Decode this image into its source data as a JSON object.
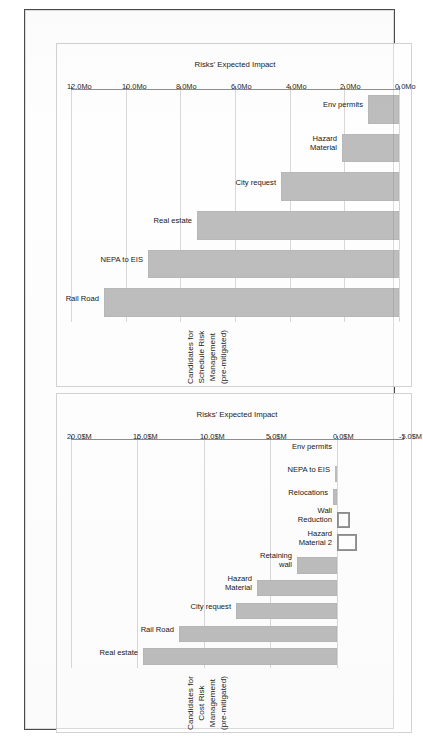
{
  "document": {
    "kind": "scanned-report-page",
    "orientation": "rotated-90-ccw",
    "page_background": "#fefefe",
    "border_color": "#4a4a4a"
  },
  "palette": {
    "bar_fill": "#bdbdbd",
    "bar_negative_fill": "#ffffff",
    "bar_negative_stroke": "#8c8c8c",
    "gridline": "#d8d8d8",
    "axis": "#8e8e8e",
    "text": "#1b1b1b"
  },
  "charts": [
    {
      "id": "schedule",
      "title_line1": "Candidates for Schedule Risk Management",
      "title_line2": "(pre-mitigated)",
      "axis_title": "Risks' Expected Impact"
    },
    {
      "id": "cost",
      "title_line1": "Candidates for Cost Risk Management",
      "title_line2": "(pre-mitigated)",
      "axis_title": "Risks' Expected Impact"
    }
  ],
  "chart_data": [
    {
      "type": "bar",
      "id": "schedule",
      "orientation": "vertical",
      "title": "Candidates for Schedule Risk Management (pre-mitigated)",
      "subtitle": "(pre-mitigated)",
      "xlabel": "",
      "ylabel": "Risks' Expected Impact",
      "unit": "Mo",
      "ylim": [
        0.0,
        12.0
      ],
      "ticks": [
        0.0,
        2.0,
        4.0,
        6.0,
        8.0,
        10.0,
        12.0
      ],
      "ticklabels": [
        "0.0Mo",
        "2.0Mo",
        "4.0Mo",
        "6.0Mo",
        "8.0Mo",
        "10.0Mo",
        "12.0Mo"
      ],
      "grid": true,
      "legend": false,
      "categories": [
        "Rail Road",
        "NEPA to EIS",
        "Real estate",
        "City request",
        "Hazard Material",
        "Env permits"
      ],
      "category_labels": [
        "Rail Road",
        "NEPA to EIS",
        "Real estate",
        "City request",
        "Hazard\nMaterial",
        "Env permits"
      ],
      "values": [
        10.8,
        9.2,
        7.4,
        4.3,
        2.1,
        1.15
      ]
    },
    {
      "type": "bar",
      "id": "cost",
      "orientation": "vertical",
      "title": "Candidates for Cost Risk Management (pre-mitigated)",
      "subtitle": "(pre-mitigated)",
      "xlabel": "",
      "ylabel": "Risks' Expected Impact",
      "unit": "$M",
      "ylim": [
        -5.0,
        20.0
      ],
      "ticks": [
        -5.0,
        0.0,
        5.0,
        10.0,
        15.0,
        20.0
      ],
      "ticklabels": [
        "-5.0$M",
        "0.0$M",
        "5.0$M",
        "10.0$M",
        "15.0$M",
        "20.0$M"
      ],
      "grid": true,
      "legend": false,
      "categories": [
        "Real estate",
        "Rail Road",
        "City request",
        "Hazard Material",
        "Retaining wall",
        "Hazard Material 2",
        "Wall Reduction",
        "Relocations",
        "NEPA to EIS",
        "Env permits"
      ],
      "category_labels": [
        "Real estate",
        "Rail Road",
        "City request",
        "Hazard\nMaterial",
        "Retaining\nwall",
        "Hazard\nMaterial 2",
        "Wall\nReduction",
        "Relocations",
        "NEPA to EIS",
        "Env permits"
      ],
      "values": [
        14.6,
        11.9,
        7.6,
        6.0,
        3.0,
        -1.5,
        -1.0,
        0.25,
        0.12,
        0.0
      ]
    }
  ]
}
